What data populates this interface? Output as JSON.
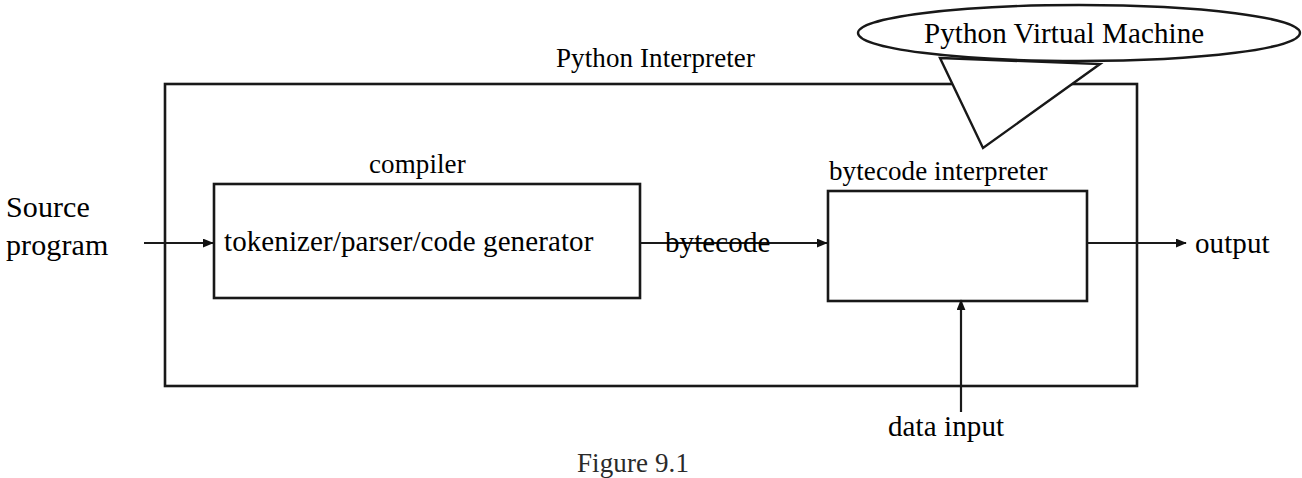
{
  "figure": {
    "caption": "Figure 9.1",
    "title": "Python Interpreter"
  },
  "labels": {
    "source_program_line1": "Source",
    "source_program_line2": "program",
    "compiler": "compiler",
    "tokenizer": "tokenizer/parser/code generator",
    "bytecode": "bytecode",
    "bytecode_interpreter": "bytecode interpreter",
    "python_interpreter": "Python Interpreter",
    "python_virtual_machine": "Python Virtual Machine",
    "output": "output",
    "data_input": "data input"
  },
  "colors": {
    "stroke": "#181818",
    "background": "#ffffff",
    "text": "#000000"
  },
  "geometry": {
    "outer_box": {
      "x": 165,
      "y": 84,
      "w": 972,
      "h": 302
    },
    "compiler_box": {
      "x": 214,
      "y": 184,
      "w": 426,
      "h": 114
    },
    "interpreter_box": {
      "x": 828,
      "y": 191,
      "w": 259,
      "h": 110
    },
    "callout_ellipse": {
      "cx": 1079,
      "cy": 33,
      "rx": 221,
      "ry": 28
    }
  }
}
